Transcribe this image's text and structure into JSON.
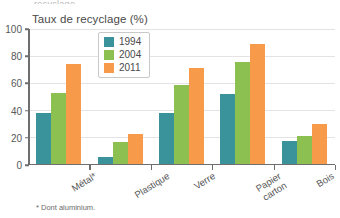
{
  "top_crop_text": "recyclage",
  "footnote": "* Dont aluminium.",
  "colors": {
    "series_1994": "#3a929b",
    "series_2004": "#8cc152",
    "series_2011": "#f79a4a",
    "gridline": "#e3e3e3",
    "axis": "#6e6e6e",
    "text": "#4a4a4a",
    "background": "#ffffff"
  },
  "legend": {
    "position": "inside-top-left",
    "entries": [
      {
        "label": "1994",
        "color": "#3a929b"
      },
      {
        "label": "2004",
        "color": "#8cc152"
      },
      {
        "label": "2011",
        "color": "#f79a4a"
      }
    ]
  },
  "axes": {
    "y_ticks": [
      "0",
      "20",
      "40",
      "60",
      "80",
      "100"
    ],
    "y_min": 0,
    "y_max": 100
  },
  "chart_data": {
    "type": "bar",
    "title": "Taux de recyclage (%)",
    "xlabel": "",
    "ylabel": "",
    "ylim": [
      0,
      100
    ],
    "yticks": [
      0,
      20,
      40,
      60,
      80,
      100
    ],
    "grid": true,
    "legend_position": "inside top-left",
    "categories": [
      "Métal*",
      "Plastique",
      "Verre",
      "Papier carton",
      "Bois"
    ],
    "category_lines": [
      [
        "Métal*"
      ],
      [
        "Plastique"
      ],
      [
        "Verre"
      ],
      [
        "Papier",
        "carton"
      ],
      [
        "Bois"
      ]
    ],
    "series": [
      {
        "name": "1994",
        "color": "#3a929b",
        "values": [
          38,
          6,
          38,
          52,
          18
        ]
      },
      {
        "name": "2004",
        "color": "#8cc152",
        "values": [
          53,
          17,
          59,
          76,
          21
        ]
      },
      {
        "name": "2011",
        "color": "#f79a4a",
        "values": [
          74,
          23,
          71,
          89,
          30
        ]
      }
    ],
    "annotations": [
      "* Dont aluminium."
    ]
  }
}
